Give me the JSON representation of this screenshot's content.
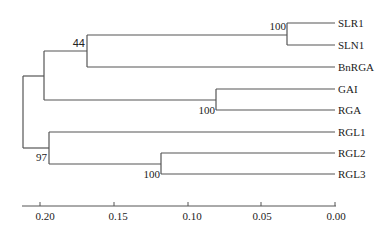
{
  "tree": {
    "leaves": [
      {
        "name": "SLR1",
        "y": 23
      },
      {
        "name": "SLN1",
        "y": 45
      },
      {
        "name": "BnRGA",
        "y": 67
      },
      {
        "name": "GAI",
        "y": 89
      },
      {
        "name": "RGA",
        "y": 110
      },
      {
        "name": "RGL1",
        "y": 132
      },
      {
        "name": "RGL2",
        "y": 153
      },
      {
        "name": "RGL3",
        "y": 174
      }
    ],
    "support_values": {
      "slr1_sln1": "100",
      "slr_bnrga": "44",
      "gai_rga": "100",
      "rgl_clade": "97",
      "rgl2_rgl3": "100"
    },
    "distance_units": "substitutions per site"
  },
  "axis": {
    "ticks": [
      {
        "label": "0.20",
        "value": 0.2
      },
      {
        "label": "0.15",
        "value": 0.15
      },
      {
        "label": "0.10",
        "value": 0.1
      },
      {
        "label": "0.05",
        "value": 0.05
      },
      {
        "label": "0.00",
        "value": 0.0
      }
    ]
  },
  "colors": {
    "line": "#555555",
    "text": "#222222",
    "background": "#ffffff"
  }
}
